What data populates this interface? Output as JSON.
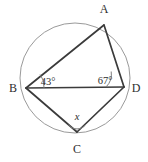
{
  "figure": {
    "type": "cyclic-quadrilateral-in-circle",
    "background_color": "#ffffff",
    "circle_color": "#9a9a9a",
    "line_color": "#3b3b3b",
    "arc_color": "#7d7d7d"
  },
  "vertices": {
    "a": {
      "label": "A",
      "x": 104,
      "y": 25,
      "label_x": 104,
      "label_y": 13
    },
    "b": {
      "label": "B",
      "x": 26,
      "y": 88,
      "label_x": 13,
      "label_y": 92
    },
    "c": {
      "label": "C",
      "x": 77,
      "y": 132,
      "label_x": 77,
      "label_y": 153
    },
    "d": {
      "label": "D",
      "x": 124,
      "y": 87,
      "label_x": 136,
      "label_y": 92
    }
  },
  "circle": {
    "center_x": 75,
    "center_y": 78,
    "radius": 55
  },
  "angles": [
    {
      "id": "angle-at-b",
      "vertex": "B",
      "label": "43°",
      "value": 43,
      "label_x": 48,
      "label_y": 85,
      "arc_radius": 18
    },
    {
      "id": "angle-at-d",
      "vertex": "D",
      "label": "67°",
      "value": 67,
      "label_x": 105,
      "label_y": 84,
      "arc_radius": 18
    },
    {
      "id": "angle-at-c",
      "vertex": "C",
      "label": "x",
      "value": null,
      "label_x": 77,
      "label_y": 120,
      "arc_radius": 11
    }
  ],
  "segments": [
    {
      "id": "segment-ab",
      "from": "A",
      "to": "B"
    },
    {
      "id": "segment-ad",
      "from": "A",
      "to": "D"
    },
    {
      "id": "segment-bc",
      "from": "B",
      "to": "C"
    },
    {
      "id": "segment-cd",
      "from": "C",
      "to": "D"
    },
    {
      "id": "segment-bd-diagonal",
      "from": "B",
      "to": "D"
    }
  ]
}
